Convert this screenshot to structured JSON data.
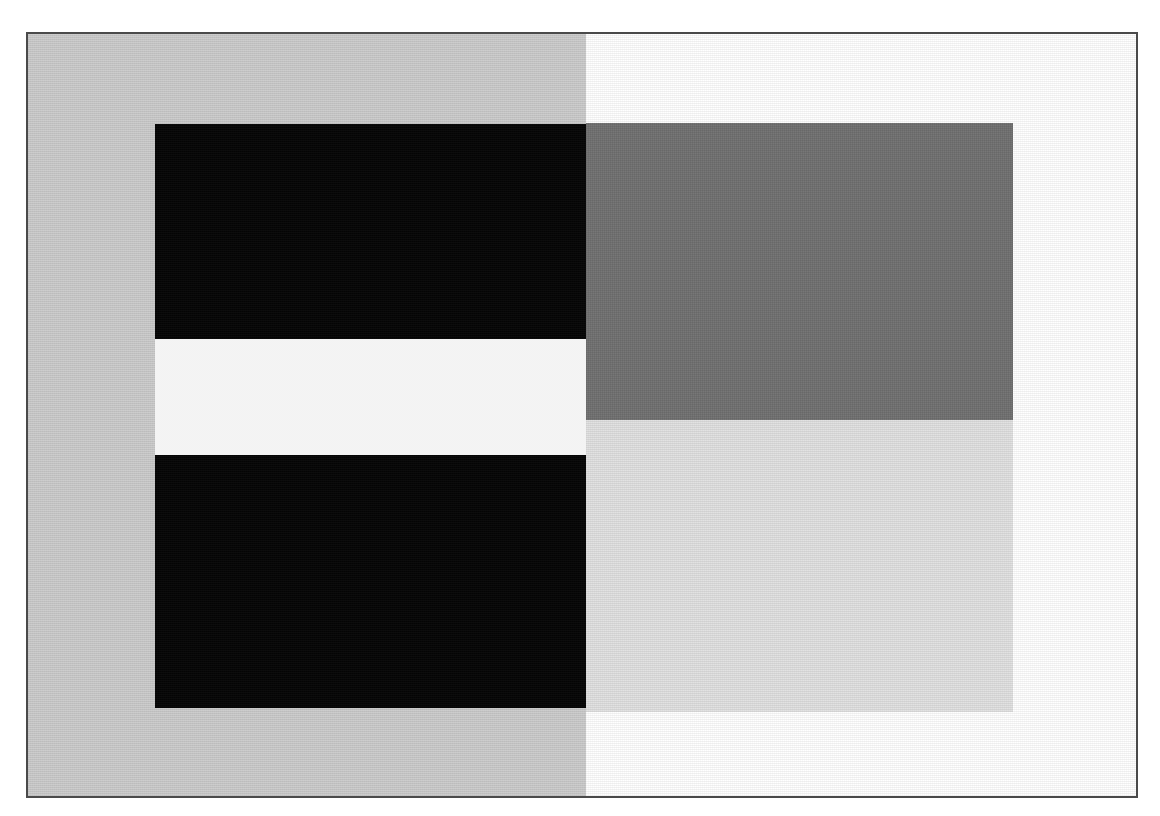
{
  "figure": {
    "canvas": {
      "width": 1160,
      "height": 816,
      "background": "#ffffff"
    },
    "frame": {
      "name": "outer plate border",
      "x": 26,
      "y": 32,
      "width": 1112,
      "height": 766,
      "border_color": "#4a4a4a",
      "border_width": 2,
      "fill": "#ffffff"
    },
    "backgrounds": [
      {
        "name": "left background field",
        "side": "left",
        "color": "#cbcbcb",
        "label": "mid gray surround",
        "x": 0,
        "y": 0,
        "width": 558,
        "height": 762
      },
      {
        "name": "right background field",
        "side": "right",
        "color": "#ffffff",
        "label": "white surround",
        "x": 558,
        "y": 0,
        "width": 554,
        "height": 762
      }
    ],
    "patches": [
      {
        "name": "upper black bar",
        "color": "#050505",
        "tone": "black",
        "x": 127,
        "y": 90,
        "width": 431,
        "height": 215
      },
      {
        "name": "center white band",
        "color": "#fdfdfd",
        "tone": "white",
        "x": 127,
        "y": 305,
        "width": 431,
        "height": 116
      },
      {
        "name": "lower black bar",
        "color": "#050505",
        "tone": "black",
        "x": 127,
        "y": 421,
        "width": 431,
        "height": 253
      },
      {
        "name": "upper right dark gray block",
        "color": "#6e6e6e",
        "tone": "dark gray",
        "x": 558,
        "y": 89,
        "width": 427,
        "height": 297
      },
      {
        "name": "lower right light gray block",
        "color": "#e0e0e0",
        "tone": "light gray",
        "x": 558,
        "y": 386,
        "width": 427,
        "height": 292
      }
    ]
  }
}
